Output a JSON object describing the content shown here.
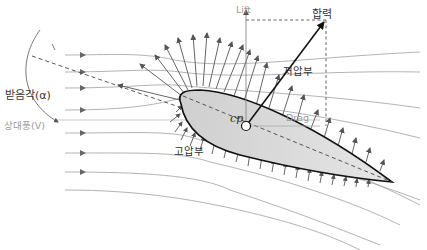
{
  "labels": {
    "lift": "Lift",
    "resultant": "합력",
    "low_pressure": "저압부",
    "high_pressure": "고압부",
    "drag": "Drag",
    "center_of_pressure": "cp",
    "angle_of_attack": "받음각(α)",
    "relative_wind": "상대풍(V)"
  },
  "colors": {
    "stroke": "#555555",
    "airfoil_outline": "#111111",
    "airfoil_fill": "#d4d4d4",
    "streamline": "#9a9a9a",
    "resultant": "#111111"
  }
}
